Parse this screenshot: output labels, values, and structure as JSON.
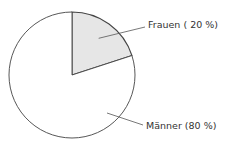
{
  "chart_data": {
    "type": "pie",
    "title": "",
    "start_angle_deg": 0,
    "direction": "clockwise",
    "slices": [
      {
        "label": "Frauen",
        "value": 20,
        "display": "Frauen ( 20 %)",
        "color": "#e6e6e6"
      },
      {
        "label": "Männer",
        "value": 80,
        "display": "Männer (80 %)",
        "color": "#ffffff"
      }
    ],
    "unit": "%",
    "stroke_color": "#444444"
  }
}
